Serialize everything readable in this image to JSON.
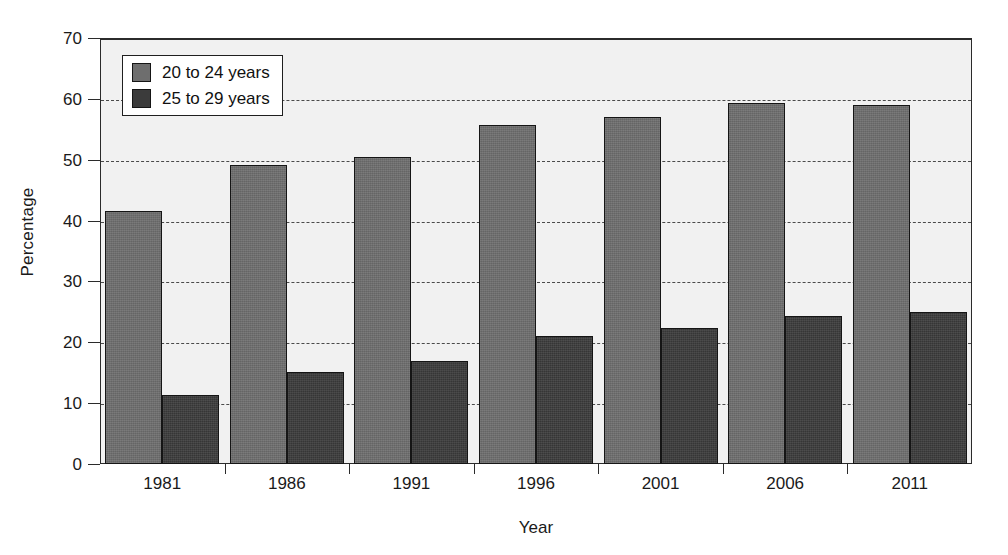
{
  "chart_data": {
    "type": "bar",
    "title": "",
    "subtitle": "",
    "xlabel": "Year",
    "ylabel": "Percentage",
    "categories": [
      "1981",
      "1986",
      "1991",
      "1996",
      "2001",
      "2006",
      "2011"
    ],
    "series": [
      {
        "name": "20 to 24 years",
        "color": "#6e6e6e",
        "values": [
          41.5,
          49.2,
          50.4,
          55.7,
          57.0,
          59.4,
          59.0
        ]
      },
      {
        "name": "25 to 29 years",
        "color": "#3b3b3b",
        "values": [
          11.3,
          15.1,
          16.9,
          21.0,
          22.3,
          24.4,
          25.0
        ]
      }
    ],
    "ylim": [
      0,
      70
    ],
    "ytick_step": 10,
    "yticks": [
      "0",
      "10",
      "20",
      "30",
      "40",
      "50",
      "60",
      "70"
    ],
    "grid": "horizontal-dashed",
    "legend_position": "top-left-inside",
    "plot_background": "#f1f1f1",
    "frame_color": "#2b2b2b"
  },
  "legend": {
    "entries": [
      {
        "label": "20 to 24 years"
      },
      {
        "label": "25 to 29 years"
      }
    ]
  },
  "axes": {
    "y_title": "Percentage",
    "x_title": "Year"
  }
}
